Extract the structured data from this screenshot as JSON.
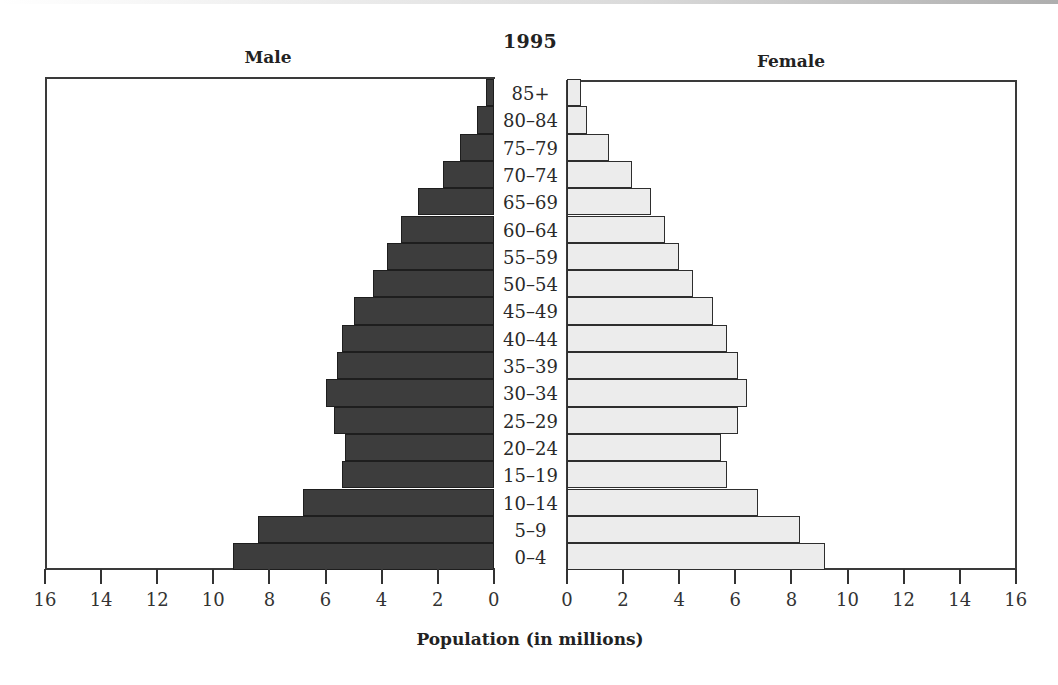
{
  "chart_data": {
    "type": "bar",
    "orientation": "horizontal",
    "subtype": "population-pyramid",
    "title": "1995",
    "xlabel": "Population (in millions)",
    "ylabel": "",
    "xlim": [
      0,
      16
    ],
    "x_ticks": [
      0,
      2,
      4,
      6,
      8,
      10,
      12,
      14,
      16
    ],
    "grid": false,
    "legend": "none",
    "categories": [
      "85+",
      "80–84",
      "75–79",
      "70–74",
      "65–69",
      "60–64",
      "55–59",
      "50–54",
      "45–49",
      "40–44",
      "35–39",
      "30–34",
      "25–29",
      "20–24",
      "15–19",
      "10–14",
      "5–9",
      "0–4"
    ],
    "series": [
      {
        "name": "Male",
        "color": "#3d3d3d",
        "side": "left",
        "values": [
          0.3,
          0.6,
          1.2,
          1.8,
          2.7,
          3.3,
          3.8,
          4.3,
          5.0,
          5.4,
          5.6,
          6.0,
          5.7,
          5.3,
          5.4,
          6.8,
          8.4,
          9.3
        ]
      },
      {
        "name": "Female",
        "color": "#ececec",
        "side": "right",
        "values": [
          0.5,
          0.7,
          1.5,
          2.3,
          3.0,
          3.5,
          4.0,
          4.5,
          5.2,
          5.7,
          6.1,
          6.4,
          6.1,
          5.5,
          5.7,
          6.8,
          8.3,
          9.2
        ]
      }
    ]
  },
  "labels": {
    "year": "1995",
    "male": "Male",
    "female": "Female",
    "axis_title": "Population (in millions)"
  },
  "axis": {
    "male_ticks": [
      "16",
      "14",
      "12",
      "10",
      "8",
      "6",
      "4",
      "2",
      "0"
    ],
    "female_ticks": [
      "0",
      "2",
      "4",
      "6",
      "8",
      "10",
      "12",
      "14",
      "16"
    ]
  }
}
